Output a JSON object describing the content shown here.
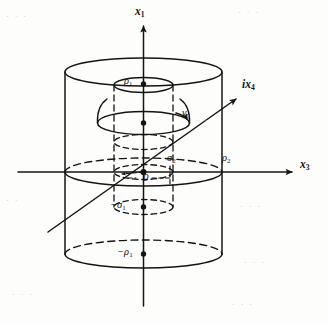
{
  "figure": {
    "caption_visible": false,
    "background_color": "#fdfdfb",
    "ink_color": "#141414",
    "axes": [
      {
        "id": "x1",
        "label": "x",
        "sub": "1",
        "direction": "up",
        "label_x": 138,
        "label_y": 8,
        "tip_x": 143,
        "tip_y": 22,
        "tail_x": 143,
        "tail_y": 306
      },
      {
        "id": "x3",
        "label": "x",
        "sub": "3",
        "direction": "right",
        "label_x": 303,
        "label_y": 165,
        "tip_x": 296,
        "tip_y": 172,
        "tail_x": 18,
        "tail_y": 172
      },
      {
        "id": "ix4",
        "label": "ix",
        "sub": "4",
        "direction": "up-right",
        "label_x": 246,
        "label_y": 86,
        "tip_x": 240,
        "tip_y": 96,
        "tail_x": 48,
        "tail_y": 232
      }
    ],
    "labels": [
      {
        "id": "rho1",
        "text": "ρ",
        "sub": "1",
        "prefix": "",
        "x": 126,
        "y": 79,
        "role": "top-inner-circle-radius"
      },
      {
        "id": "gamma_r",
        "text": "γ",
        "sub": "r",
        "prefix": "",
        "x": 184,
        "y": 113,
        "role": "contour-curve"
      },
      {
        "id": "sigma2",
        "text": "σ",
        "sub": "2",
        "prefix": "",
        "x": 170,
        "y": 160,
        "role": "inner-radius-equator"
      },
      {
        "id": "rho2",
        "text": "ρ",
        "sub": "2",
        "prefix": "",
        "x": 224,
        "y": 160,
        "role": "outer-radius-equator"
      },
      {
        "id": "origin",
        "text": "0",
        "sub": "",
        "prefix": "",
        "x": 144,
        "y": 177,
        "role": "origin"
      },
      {
        "id": "neg_sigma1",
        "text": "σ",
        "sub": "1",
        "prefix": "−",
        "x": 112,
        "y": 203,
        "role": "inner-lower-height"
      },
      {
        "id": "neg_rho1",
        "text": "ρ",
        "sub": "1",
        "prefix": "−",
        "x": 120,
        "y": 250,
        "role": "bottom-circle-radius"
      }
    ],
    "points": [
      {
        "id": "pt-rho1",
        "x": 143,
        "y": 84,
        "r": 2.6
      },
      {
        "id": "pt-gamma",
        "x": 143,
        "y": 123,
        "r": 2.6
      },
      {
        "id": "pt-origin",
        "x": 143,
        "y": 172,
        "r": 3.0
      },
      {
        "id": "pt-neg-sigma1",
        "x": 143,
        "y": 207,
        "r": 2.6
      },
      {
        "id": "pt-neg-rho1",
        "x": 143,
        "y": 254,
        "r": 2.6
      }
    ],
    "cylinders": [
      {
        "id": "outer-cylinder",
        "cx": 143.5,
        "rx": 78.5,
        "ry": 14,
        "top_y": 72,
        "equator_y": 172,
        "bottom_y": 254,
        "left_x": 65,
        "right_x": 222
      },
      {
        "id": "inner-cylinder",
        "cx": 143.5,
        "rx": 28.5,
        "ry": 6.5,
        "top_y": 85,
        "equator_y": 172,
        "bottom_y": 207,
        "left_x": 115,
        "right_x": 172
      },
      {
        "id": "gamma-contour-ellipse",
        "cx": 143.5,
        "rx": 46,
        "ry": 11,
        "cy": 123
      }
    ],
    "ghost_text": [
      {
        "x": 6,
        "y": 18,
        "text": "·   ·    ·"
      },
      {
        "x": 238,
        "y": 14,
        "text": "·  ·   ·"
      },
      {
        "x": 190,
        "y": 118,
        "text": "· ·"
      },
      {
        "x": 6,
        "y": 200,
        "text": "·  ·"
      },
      {
        "x": 236,
        "y": 206,
        "text": "· ·  ·"
      },
      {
        "x": 242,
        "y": 262,
        "text": "·  ·  ·"
      },
      {
        "x": 12,
        "y": 292,
        "text": "·  ·   ·"
      },
      {
        "x": 230,
        "y": 300,
        "text": "·  ·  ·"
      }
    ]
  }
}
